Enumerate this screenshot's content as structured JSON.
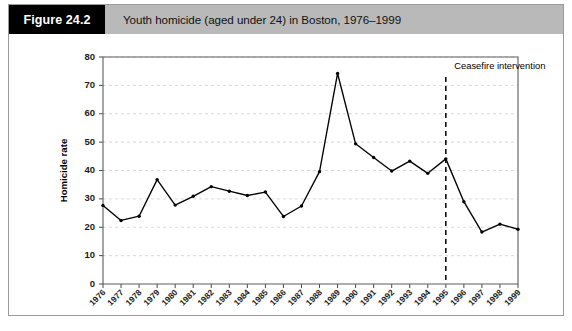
{
  "figure": {
    "number_label": "Figure 24.2",
    "caption": "Youth homicide (aged under 24) in Boston, 1976–1999",
    "header_bg": "#b9b9b9",
    "number_bg": "#000000",
    "number_fg": "#ffffff",
    "border_color": "#9a9a9a"
  },
  "chart_data": {
    "type": "line",
    "title": "Youth homicide (aged under 24) in Boston, 1976–1999",
    "xlabel": "",
    "ylabel": "Homicide rate",
    "categories": [
      "1976",
      "1977",
      "1978",
      "1979",
      "1980",
      "1981",
      "1982",
      "1983",
      "1984",
      "1985",
      "1986",
      "1987",
      "1988",
      "1989",
      "1990",
      "1991",
      "1992",
      "1993",
      "1994",
      "1995",
      "1996",
      "1997",
      "1998",
      "1999"
    ],
    "values": [
      27.7,
      22.4,
      23.9,
      36.8,
      27.8,
      30.9,
      34.3,
      32.7,
      31.2,
      32.4,
      23.8,
      27.5,
      39.6,
      74.2,
      49.4,
      44.6,
      39.8,
      43.3,
      39.0,
      44.1,
      29.0,
      18.3,
      21.1,
      19.3
    ],
    "series": [
      {
        "name": "Homicide rate",
        "color": "#000000",
        "values": [
          27.7,
          22.4,
          23.9,
          36.8,
          27.8,
          30.9,
          34.3,
          32.7,
          31.2,
          32.4,
          23.8,
          27.5,
          39.6,
          74.2,
          49.4,
          44.6,
          39.8,
          43.3,
          39.0,
          44.1,
          29.0,
          18.3,
          21.1,
          19.3
        ]
      }
    ],
    "ylim": [
      0,
      80
    ],
    "ytick_values": [
      0,
      10,
      20,
      30,
      40,
      50,
      60,
      70,
      80
    ],
    "ytick_labels": [
      "0",
      "10",
      "20",
      "30",
      "40",
      "50",
      "60",
      "70",
      "80"
    ],
    "grid": true,
    "legend": false,
    "annotations": [
      {
        "label": "Ceasefire intervention",
        "at_category": "1995",
        "style": "vertical-dashed-line",
        "color": "#000000"
      }
    ]
  }
}
